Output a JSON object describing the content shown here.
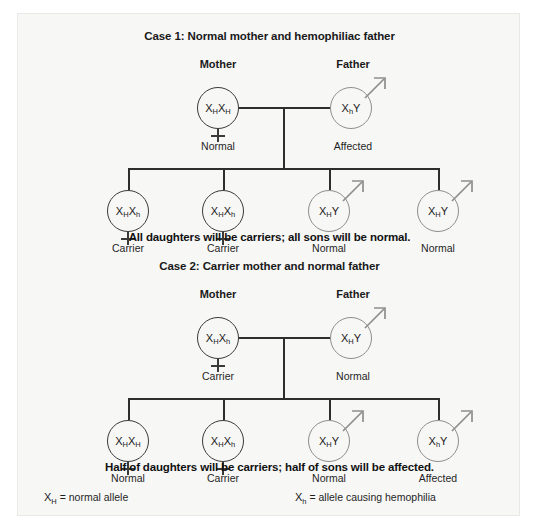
{
  "figure": {
    "background_color": "#f7f7f6",
    "female_stroke_color": "#3a3a3a",
    "male_stroke_color": "#8e8e8e",
    "line_color": "#2e2e2e"
  },
  "cases": [
    {
      "id": "case-1",
      "title": "Case 1: Normal mother and hemophiliac father",
      "parents": [
        {
          "role": "Mother",
          "sex": "female",
          "genotype": {
            "allele1": "X",
            "sub1": "H",
            "allele2": "X",
            "sub2": "H"
          },
          "status": "Normal"
        },
        {
          "role": "Father",
          "sex": "male",
          "genotype": {
            "allele1": "X",
            "sub1": "h",
            "allele2": "Y",
            "sub2": ""
          },
          "status": "Affected"
        }
      ],
      "offspring": [
        {
          "sex": "female",
          "genotype": {
            "allele1": "X",
            "sub1": "H",
            "allele2": "X",
            "sub2": "h"
          },
          "status": "Carrier"
        },
        {
          "sex": "female",
          "genotype": {
            "allele1": "X",
            "sub1": "H",
            "allele2": "X",
            "sub2": "h"
          },
          "status": "Carrier"
        },
        {
          "sex": "male",
          "genotype": {
            "allele1": "X",
            "sub1": "H",
            "allele2": "Y",
            "sub2": ""
          },
          "status": "Normal"
        },
        {
          "sex": "male",
          "genotype": {
            "allele1": "X",
            "sub1": "H",
            "allele2": "Y",
            "sub2": ""
          },
          "status": "Normal"
        }
      ],
      "summary": "All daughters will be carriers; all sons will be normal."
    },
    {
      "id": "case-2",
      "title": "Case 2: Carrier mother and normal father",
      "parents": [
        {
          "role": "Mother",
          "sex": "female",
          "genotype": {
            "allele1": "X",
            "sub1": "H",
            "allele2": "X",
            "sub2": "h"
          },
          "status": "Carrier"
        },
        {
          "role": "Father",
          "sex": "male",
          "genotype": {
            "allele1": "X",
            "sub1": "H",
            "allele2": "Y",
            "sub2": ""
          },
          "status": "Normal"
        }
      ],
      "offspring": [
        {
          "sex": "female",
          "genotype": {
            "allele1": "X",
            "sub1": "H",
            "allele2": "X",
            "sub2": "H"
          },
          "status": "Normal"
        },
        {
          "sex": "female",
          "genotype": {
            "allele1": "X",
            "sub1": "H",
            "allele2": "X",
            "sub2": "h"
          },
          "status": "Carrier"
        },
        {
          "sex": "male",
          "genotype": {
            "allele1": "X",
            "sub1": "H",
            "allele2": "Y",
            "sub2": ""
          },
          "status": "Normal"
        },
        {
          "sex": "male",
          "genotype": {
            "allele1": "X",
            "sub1": "h",
            "allele2": "Y",
            "sub2": ""
          },
          "status": "Affected"
        }
      ],
      "summary": "Half of daughters will be carriers; half of sons will be affected."
    }
  ],
  "legend": [
    {
      "symbol": "X",
      "sub": "H",
      "text": " = normal allele"
    },
    {
      "symbol": "X",
      "sub": "h",
      "text": " = allele causing hemophilia"
    }
  ]
}
